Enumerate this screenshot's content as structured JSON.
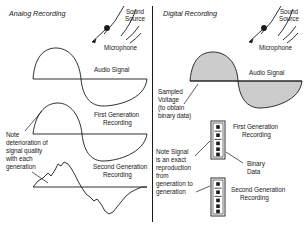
{
  "figure": {
    "type": "diagram",
    "background_color": "#ffffff",
    "line_color": "#1a1a1a",
    "fill_color": "#cccccc",
    "divider": {
      "name": "vertical-divider",
      "x": 152,
      "y1": 6,
      "y2": 222
    }
  },
  "panels": [
    {
      "id": "analog",
      "title": "Analog Recording",
      "source": {
        "sound_source_label": "Sound\nSource",
        "microphone_label": "Microphone"
      },
      "waves": [
        {
          "id": "audio-signal",
          "label": "Audio Signal",
          "shape": "smooth-sine",
          "filled": false
        },
        {
          "id": "first-generation",
          "label": "First Generation\nRecording",
          "shape": "smooth-sine-slight-distortion",
          "filled": false
        },
        {
          "id": "second-generation",
          "label": "Second Generation\nRecording",
          "shape": "jagged-degraded-sine",
          "filled": false
        }
      ],
      "note": "Note\ndeterioration of\nsignal quality\nwith each\ngeneration"
    },
    {
      "id": "digital",
      "title": "Digital Recording",
      "source": {
        "sound_source_label": "Sound\nSource",
        "microphone_label": "Microphone"
      },
      "waves": [
        {
          "id": "audio-signal",
          "label": "Audio Signal",
          "shape": "smooth-sine",
          "filled": true
        }
      ],
      "sampled_note": "Sampled\nVoltage\n(to obtain\nbinary data)",
      "binary_strips": [
        {
          "id": "first-generation",
          "label": "First Generation\nRecording",
          "bits": 5
        },
        {
          "id": "second-generation",
          "label": "Second Generation\nRecording",
          "bits": 5
        }
      ],
      "binary_data_label": "Binary\nData",
      "note": "Note Signal\nis an exact\nreproduction\nfrom\ngeneration to\ngeneration"
    }
  ],
  "labels": {
    "analog_title": "Analog Recording",
    "digital_title": "Digital Recording",
    "sound_source_a_l1": "Sound",
    "sound_source_a_l2": "Source",
    "microphone_a": "Microphone",
    "audio_signal_a": "Audio Signal",
    "first_gen_a_l1": "First Generation",
    "first_gen_a_l2": "Recording",
    "second_gen_a_l1": "Second Generation",
    "second_gen_a_l2": "Recording",
    "note_a_l1": "Note",
    "note_a_l2": "deterioration of",
    "note_a_l3": "signal quality",
    "note_a_l4": "with each",
    "note_a_l5": "generation",
    "sound_source_d_l1": "Sound",
    "sound_source_d_l2": "Source",
    "microphone_d": "Microphone",
    "audio_signal_d": "Audio Signal",
    "sampled_l1": "Sampled",
    "sampled_l2": "Voltage",
    "sampled_l3": "(to obtain",
    "sampled_l4": "binary data)",
    "first_gen_d_l1": "First Generation",
    "first_gen_d_l2": "Recording",
    "binary_data_l1": "Binary",
    "binary_data_l2": "Data",
    "note_d_l1": "Note Signal",
    "note_d_l2": "is an exact",
    "note_d_l3": "reproduction",
    "note_d_l4": "from",
    "note_d_l5": "generation to",
    "note_d_l6": "generation",
    "second_gen_d_l1": "Second Generation",
    "second_gen_d_l2": "Recording"
  }
}
